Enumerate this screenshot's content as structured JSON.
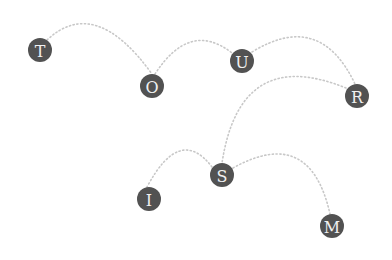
{
  "diagram": {
    "type": "letter-node-arc-diagram",
    "word": "TOURISM",
    "colors": {
      "node_fill": "#525252",
      "letter": "#f0f0f0",
      "arc_dots": "#c8c8c8",
      "background": "#ffffff"
    },
    "nodes": [
      {
        "id": "T",
        "letter": "T",
        "cx": 40,
        "cy": 50,
        "r": 12
      },
      {
        "id": "O",
        "letter": "O",
        "cx": 152,
        "cy": 86,
        "r": 12
      },
      {
        "id": "U",
        "letter": "U",
        "cx": 242,
        "cy": 61,
        "r": 12
      },
      {
        "id": "R",
        "letter": "R",
        "cx": 357,
        "cy": 96,
        "r": 12
      },
      {
        "id": "S",
        "letter": "S",
        "cx": 222,
        "cy": 175,
        "r": 12
      },
      {
        "id": "I",
        "letter": "I",
        "cx": 149,
        "cy": 199,
        "r": 12
      },
      {
        "id": "M",
        "letter": "M",
        "cx": 332,
        "cy": 226,
        "r": 12
      }
    ],
    "arcs": [
      {
        "from": "T",
        "to": "O",
        "path": "M47 40 Q95 -5 152 74"
      },
      {
        "from": "O",
        "to": "U",
        "path": "M155 74 Q190 20 232 53"
      },
      {
        "from": "U",
        "to": "R",
        "path": "M252 52 Q320 10 355 84"
      },
      {
        "from": "R",
        "to": "S",
        "path": "M346 88 Q240 45 222 163"
      },
      {
        "from": "S",
        "to": "I",
        "path": "M212 167 Q180 125 147 187"
      },
      {
        "from": "S",
        "to": "M",
        "path": "M233 168 Q310 125 330 214"
      }
    ]
  }
}
